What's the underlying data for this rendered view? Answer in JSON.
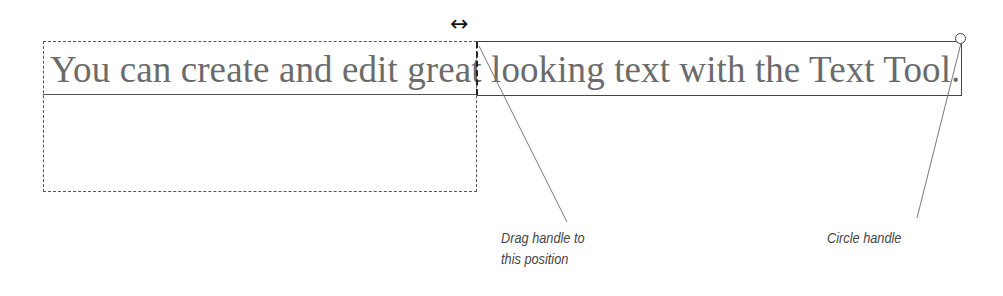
{
  "text_frame": {
    "text_part_1": "You can create and edit great ",
    "text_part_2": "looking text with the Text Tool.",
    "full_text": "You can create and edit great looking text with the Text Tool."
  },
  "handles": {
    "resize_arrow_glyph": "↔",
    "circle_handle": "circle-handle"
  },
  "callouts": {
    "drag_handle_line1": "Drag handle to",
    "drag_handle_line2": "this position",
    "circle_handle": "Circle handle"
  },
  "colors": {
    "text": "#6b6b6b",
    "frame": "#444444",
    "callout": "#444444"
  }
}
